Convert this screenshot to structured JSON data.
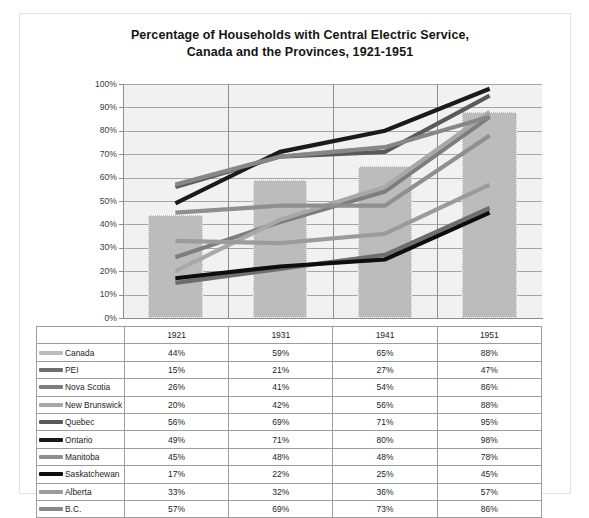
{
  "chart_data": {
    "type": "line",
    "title": "Percentage of Households  with Central Electric Service,",
    "title_line2": "Canada and the Provinces, 1921-1951",
    "xlabel": "",
    "ylabel": "",
    "categories": [
      "1921",
      "1931",
      "1941",
      "1951"
    ],
    "ylim": [
      0,
      100
    ],
    "ytick_labels": [
      "0%",
      "10%",
      "20%",
      "30%",
      "40%",
      "50%",
      "60%",
      "70%",
      "80%",
      "90%",
      "100%"
    ],
    "ytick_values": [
      0,
      10,
      20,
      30,
      40,
      50,
      60,
      70,
      80,
      90,
      100
    ],
    "grid": true,
    "legend_position": "data-table",
    "has_data_table": true,
    "series": [
      {
        "name": "Canada",
        "type": "bar",
        "color": "#bcbcbc",
        "values": [
          44,
          59,
          65,
          88
        ],
        "labels": [
          "44%",
          "59%",
          "65%",
          "88%"
        ]
      },
      {
        "name": "PEI",
        "type": "line",
        "color": "#6e6e6e",
        "values": [
          15,
          21,
          27,
          47
        ],
        "labels": [
          "15%",
          "21%",
          "27%",
          "47%"
        ]
      },
      {
        "name": "Nova Scotia",
        "type": "line",
        "color": "#7d7d7d",
        "values": [
          26,
          41,
          54,
          86
        ],
        "labels": [
          "26%",
          "41%",
          "54%",
          "86%"
        ]
      },
      {
        "name": "New Brunswick",
        "type": "line",
        "color": "#a8a8a8",
        "values": [
          20,
          42,
          56,
          88
        ],
        "labels": [
          "20%",
          "42%",
          "56%",
          "88%"
        ]
      },
      {
        "name": "Quebec",
        "type": "line",
        "color": "#5a5a5a",
        "values": [
          56,
          69,
          71,
          95
        ],
        "labels": [
          "56%",
          "69%",
          "71%",
          "95%"
        ]
      },
      {
        "name": "Ontario",
        "type": "line",
        "color": "#1a1a1a",
        "values": [
          49,
          71,
          80,
          98
        ],
        "labels": [
          "49%",
          "71%",
          "80%",
          "98%"
        ]
      },
      {
        "name": "Manitoba",
        "type": "line",
        "color": "#8f8f8f",
        "values": [
          45,
          48,
          48,
          78
        ],
        "labels": [
          "45%",
          "48%",
          "48%",
          "78%"
        ]
      },
      {
        "name": "Saskatchewan",
        "type": "line",
        "color": "#0d0d0d",
        "values": [
          17,
          22,
          25,
          45
        ],
        "labels": [
          "17%",
          "22%",
          "25%",
          "45%"
        ]
      },
      {
        "name": "Alberta",
        "type": "line",
        "color": "#9b9b9b",
        "values": [
          33,
          32,
          36,
          57
        ],
        "labels": [
          "33%",
          "32%",
          "36%",
          "57%"
        ]
      },
      {
        "name": "B.C.",
        "type": "line",
        "color": "#878787",
        "values": [
          57,
          69,
          73,
          86
        ],
        "labels": [
          "57%",
          "69%",
          "73%",
          "86%"
        ]
      }
    ]
  },
  "colors": {
    "plot_background": "#f1f1f1",
    "gridline": "#a6a6a6",
    "axis": "#8d8d8d",
    "bar_fill": "#bcbcbc",
    "page_background": "#ffffff",
    "table_border": "#9d9d9d"
  }
}
